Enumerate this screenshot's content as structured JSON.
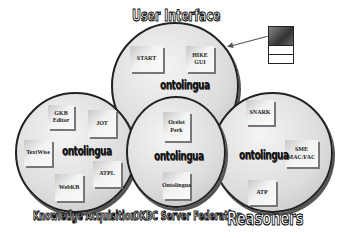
{
  "titles": {
    "top": "User Interface",
    "left": "Knowledge Acquisition",
    "middle": "OKBC Server Federation",
    "right": "Reasoners"
  },
  "logo_text": "ontolingua",
  "circles": {
    "user_interface": {
      "items": [
        "START",
        "HIKE\nGUI"
      ]
    },
    "knowledge_acquisition": {
      "items": [
        "GKB\nEditor",
        "JOT",
        "TextWise",
        "ATPL",
        "WebKB"
      ]
    },
    "okbc_server_federation": {
      "items": [
        "Ocelot\nPerk",
        "Ontolingua"
      ]
    },
    "reasoners": {
      "items": [
        "SNARK",
        "SME\nMAC/FAC",
        "ATP"
      ]
    }
  },
  "user_icon": "user-terminal-icon"
}
